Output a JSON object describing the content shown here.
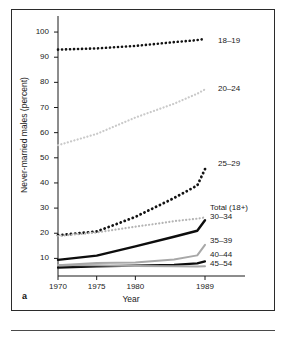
{
  "figure": {
    "panel_letter": "a",
    "background_color": "#ffffff",
    "frame_color": "#2b2b2b"
  },
  "chart_data": {
    "type": "line",
    "title": "",
    "xlabel": "Year",
    "ylabel": "Never-married males (percent)",
    "xlim": [
      1970,
      1989
    ],
    "ylim": [
      3,
      104
    ],
    "xticks": [
      1970,
      1975,
      1980,
      1989
    ],
    "xtick_labels": [
      "1970",
      "1975",
      "1980",
      "1989"
    ],
    "yticks": [
      10,
      20,
      30,
      40,
      50,
      60,
      70,
      80,
      90,
      100
    ],
    "ytick_labels": [
      "10",
      "20",
      "30",
      "40",
      "50",
      "60",
      "70",
      "80",
      "90",
      "100"
    ],
    "grid": false,
    "legend": "inline-right-labels",
    "x": [
      1970,
      1975,
      1980,
      1985,
      1988,
      1989
    ],
    "series": [
      {
        "name": "18-19",
        "label": "18–19",
        "values": [
          93.0,
          93.5,
          94.5,
          96.0,
          96.8,
          97.3
        ],
        "style": "dotted",
        "color": "#121212",
        "width": 2.6
      },
      {
        "name": "20-24",
        "label": "20–24",
        "values": [
          55.0,
          59.5,
          66.0,
          71.5,
          75.5,
          77.2
        ],
        "style": "dotted",
        "color": "#c9c9c9",
        "width": 2.2
      },
      {
        "name": "25-29",
        "label": "25–29",
        "values": [
          19.2,
          20.7,
          26.5,
          34.0,
          39.0,
          45.5
        ],
        "style": "dotted",
        "color": "#121212",
        "width": 2.8
      },
      {
        "name": "total-18-plus",
        "label": "Total (18+)",
        "values": [
          18.9,
          20.3,
          22.6,
          24.8,
          25.8,
          26.3
        ],
        "style": "dotted",
        "color": "#b4b4b4",
        "width": 2.2
      },
      {
        "name": "30-34",
        "label": "30–34",
        "values": [
          9.4,
          11.1,
          14.8,
          18.6,
          21.0,
          25.2
        ],
        "style": "solid",
        "color": "#0d0d0d",
        "width": 2.4
      },
      {
        "name": "35-39",
        "label": "35–39",
        "values": [
          7.3,
          8.2,
          8.4,
          9.6,
          11.2,
          15.4
        ],
        "style": "solid",
        "color": "#a8a8a8",
        "width": 2.0
      },
      {
        "name": "40-44",
        "label": "40–44",
        "values": [
          6.3,
          6.8,
          7.1,
          7.4,
          8.0,
          8.8
        ],
        "style": "solid",
        "color": "#0d0d0d",
        "width": 2.2
      },
      {
        "name": "45-54",
        "label": "45–54",
        "values": [
          7.4,
          7.3,
          7.0,
          6.9,
          6.8,
          6.9
        ],
        "style": "solid",
        "color": "#a8a8a8",
        "width": 2.0
      }
    ],
    "series_label_positions": [
      {
        "label": "18–19",
        "left": 218,
        "top": 36
      },
      {
        "label": "20–24",
        "left": 218,
        "top": 84
      },
      {
        "label": "25–29",
        "left": 218,
        "top": 159
      },
      {
        "label": "Total (18+)",
        "left": 210,
        "top": 203
      },
      {
        "label": "30–34",
        "left": 210,
        "top": 212
      },
      {
        "label": "35–39",
        "left": 210,
        "top": 236
      },
      {
        "label": "40–44",
        "left": 210,
        "top": 250
      },
      {
        "label": "45–54",
        "left": 210,
        "top": 259
      }
    ]
  }
}
